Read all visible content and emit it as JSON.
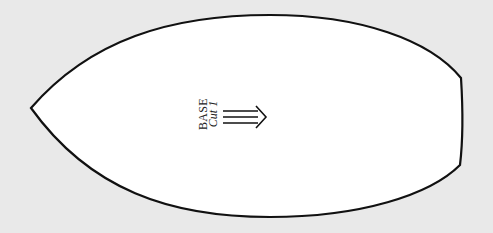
{
  "pattern_piece": {
    "name": "BASE",
    "cut_instruction": "Cut 1",
    "grainline_arrow": "double-line-right-arrow",
    "outline_color": "#111111",
    "fill_color": "#ffffff",
    "background_color": "#e9e9e9"
  }
}
